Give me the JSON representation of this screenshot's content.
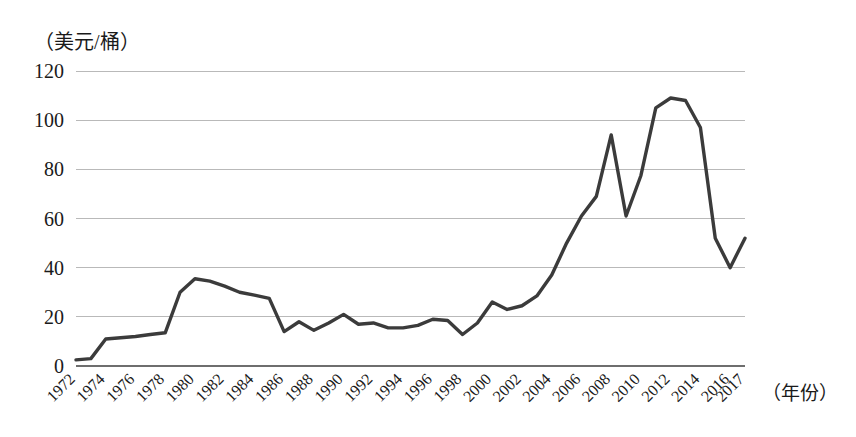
{
  "chart_data": {
    "type": "line",
    "title": "",
    "subtitle": "",
    "ylabel": "（美元/桶）",
    "xlabel": "（年份）",
    "ylim": [
      0,
      120
    ],
    "ytick_step": 20,
    "yticks": [
      "0",
      "20",
      "40",
      "60",
      "80",
      "100",
      "120"
    ],
    "grid": true,
    "legend": "none",
    "xtick_labels": [
      "1972",
      "1974",
      "1976",
      "1978",
      "1980",
      "1982",
      "1984",
      "1986",
      "1988",
      "1990",
      "1992",
      "1994",
      "1996",
      "1998",
      "2000",
      "2002",
      "2004",
      "2006",
      "2008",
      "2010",
      "2012",
      "2014",
      "2016",
      "2017"
    ],
    "xlim": [
      1972,
      2017
    ],
    "line_color": "#3b3b3b",
    "grid_color": "#b9b9b9",
    "x": [
      1972,
      1973,
      1974,
      1975,
      1976,
      1977,
      1978,
      1979,
      1980,
      1981,
      1982,
      1983,
      1984,
      1985,
      1986,
      1987,
      1988,
      1989,
      1990,
      1991,
      1992,
      1993,
      1994,
      1995,
      1996,
      1997,
      1998,
      1999,
      2000,
      2001,
      2002,
      2003,
      2004,
      2005,
      2006,
      2007,
      2008,
      2009,
      2010,
      2011,
      2012,
      2013,
      2014,
      2015,
      2016,
      2017
    ],
    "values": [
      2.5,
      3.0,
      11.0,
      11.5,
      12.0,
      12.8,
      13.5,
      30.0,
      35.5,
      34.5,
      32.5,
      30.0,
      28.8,
      27.5,
      14.0,
      18.0,
      14.5,
      17.5,
      21.0,
      17.0,
      17.5,
      15.5,
      15.5,
      16.5,
      19.0,
      18.5,
      12.8,
      17.5,
      26.0,
      23.0,
      24.5,
      28.5,
      37.0,
      50.0,
      61.0,
      69.0,
      94.0,
      61.0,
      77.5,
      105.0,
      109.0,
      108.0,
      97.0,
      52.0,
      40.0,
      52.0
    ],
    "series_name": "国际原油价格"
  }
}
